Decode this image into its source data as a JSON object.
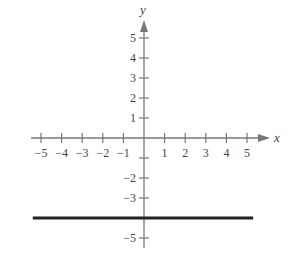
{
  "chart_data": {
    "type": "line",
    "title": "",
    "xlabel": "x",
    "ylabel": "y",
    "xlim": [
      -5,
      5
    ],
    "ylim": [
      -5,
      5
    ],
    "grid": false,
    "x_ticks": [
      -5,
      -4,
      -3,
      -2,
      -1,
      1,
      2,
      3,
      4,
      5
    ],
    "x_tick_labels": [
      "−5",
      "−4",
      "−3",
      "−2",
      "−1",
      "1",
      "2",
      "3",
      "4",
      "5"
    ],
    "y_tick_labels": [
      {
        "value": 5,
        "label": "5"
      },
      {
        "value": 4,
        "label": "4"
      },
      {
        "value": 3,
        "label": "3"
      },
      {
        "value": 2,
        "label": "2"
      },
      {
        "value": 1,
        "label": "1"
      },
      {
        "value": -2,
        "label": "−2"
      },
      {
        "value": -3,
        "label": "−3"
      },
      {
        "value": -5,
        "label": "−5"
      }
    ],
    "series": [
      {
        "name": "y = -4",
        "equation": "y = -4",
        "x": [
          -5.4,
          5.3
        ],
        "y": [
          -4,
          -4
        ],
        "color": "#222222"
      }
    ]
  },
  "colors": {
    "axis": "#666666",
    "line": "#222222",
    "text": "#444444"
  }
}
